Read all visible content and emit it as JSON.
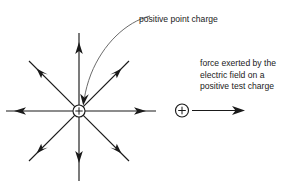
{
  "figure": {
    "background_color": "#ffffff",
    "ink_color": "#1a1a1a",
    "leader_color": "#5a5a5a"
  },
  "annotations": {
    "point_charge_label": "positive point charge",
    "force_label_lines": [
      "force exerted by the",
      "electric field on a",
      "positive test charge"
    ],
    "charge_sign": "+",
    "test_charge_sign": "+"
  },
  "diagram": {
    "source_charge": {
      "name": "positive point charge",
      "sign": "+",
      "cx": 79,
      "cy": 111,
      "r": 6
    },
    "test_charge": {
      "name": "positive test charge",
      "sign": "+",
      "cx": 182,
      "cy": 110,
      "r": 6.5
    },
    "force_arrow": {
      "x1": 189,
      "y1": 110.5,
      "x2": 244,
      "y2": 110.5
    },
    "field_lines": [
      {
        "direction": "up",
        "angle_deg": 90,
        "head_at": 47,
        "end_at": 78
      },
      {
        "direction": "upper-right",
        "angle_deg": 45,
        "head_at": 47,
        "end_at": 70
      },
      {
        "direction": "right",
        "angle_deg": 0,
        "head_at": 47,
        "end_at": 78
      },
      {
        "direction": "lower-right",
        "angle_deg": -45,
        "head_at": 47,
        "end_at": 70
      },
      {
        "direction": "down",
        "angle_deg": -90,
        "head_at": 47,
        "end_at": 78
      },
      {
        "direction": "lower-left",
        "angle_deg": -135,
        "head_at": 47,
        "end_at": 70
      },
      {
        "direction": "left",
        "angle_deg": 180,
        "head_at": 47,
        "end_at": 78
      },
      {
        "direction": "upper-left",
        "angle_deg": 135,
        "head_at": 47,
        "end_at": 70
      }
    ],
    "leader_line": {
      "from_label": "positive point charge",
      "points": "148,18 130,26 112,41 98,60 88,82 85,95"
    }
  },
  "label_positions": {
    "point_charge_label": {
      "x": 139,
      "y": 22
    },
    "force_label": {
      "x": 200,
      "y": 66,
      "line_height": 11.5
    }
  }
}
